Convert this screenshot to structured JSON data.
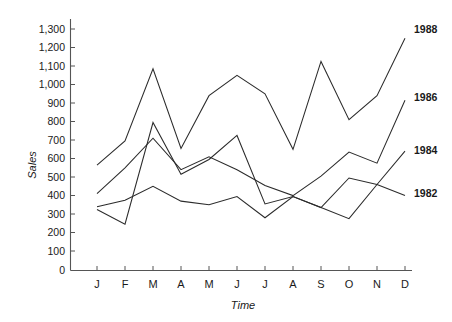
{
  "chart_data": {
    "type": "line",
    "title": "",
    "xlabel": "Time",
    "ylabel": "Sales",
    "categories": [
      "J",
      "F",
      "M",
      "A",
      "M",
      "J",
      "J",
      "A",
      "S",
      "O",
      "N",
      "D"
    ],
    "ylim": [
      0,
      1300
    ],
    "ytick_step": 100,
    "yticks": [
      "0",
      "100",
      "200",
      "300",
      "400",
      "500",
      "600",
      "700",
      "800",
      "900",
      "1,000",
      "1,100",
      "1,200",
      "1,300"
    ],
    "grid": false,
    "legend_position": "right-of-line-ends",
    "series": [
      {
        "name": "1988",
        "label": "1988",
        "values": [
          570,
          700,
          1090,
          660,
          945,
          1055,
          955,
          655,
          1130,
          815,
          945,
          1255
        ]
      },
      {
        "name": "1986",
        "label": "1986",
        "values": [
          415,
          555,
          715,
          545,
          615,
          545,
          460,
          405,
          510,
          640,
          580,
          920
        ]
      },
      {
        "name": "1984",
        "label": "1984",
        "values": [
          330,
          250,
          800,
          520,
          600,
          730,
          360,
          400,
          340,
          280,
          465,
          645
        ]
      },
      {
        "name": "1982",
        "label": "1982",
        "values": [
          345,
          380,
          455,
          375,
          355,
          400,
          285,
          400,
          340,
          500,
          465,
          405
        ]
      }
    ]
  },
  "axes": {
    "y_axis_title": "Sales",
    "x_axis_title": "Time",
    "y_labels": [
      "1,300",
      "1,200",
      "1,100",
      "1,000",
      "900",
      "800",
      "700",
      "600",
      "500",
      "400",
      "300",
      "200",
      "100",
      "0"
    ],
    "x_labels": [
      "J",
      "F",
      "M",
      "A",
      "M",
      "J",
      "J",
      "A",
      "S",
      "O",
      "N",
      "D"
    ]
  },
  "series_labels": [
    "1988",
    "1986",
    "1984",
    "1982"
  ],
  "colors": {
    "line": "#2b2b2b",
    "axis": "#555555",
    "text": "#1a1a1a",
    "background": "#ffffff"
  }
}
